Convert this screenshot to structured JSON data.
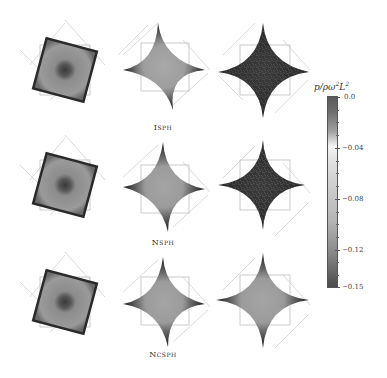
{
  "figure": {
    "rows": [
      {
        "label": "Isph",
        "label_y": 128
      },
      {
        "label": "Nsph",
        "label_y": 243
      },
      {
        "label": "Ncsph",
        "label_y": 355
      }
    ],
    "columns": 3,
    "panel_types": [
      "rotating-square",
      "star-developing",
      "star-developed"
    ]
  },
  "colorbar": {
    "title_base": "p/ρω",
    "title_exp1": "2",
    "title_mid": "L",
    "title_exp2": "2",
    "min": -0.15,
    "max": 0.0,
    "ticks": [
      {
        "value": "0.0",
        "y": 97
      },
      {
        "value": "−0.04",
        "y": 148
      },
      {
        "value": "−0.08",
        "y": 199
      },
      {
        "value": "−0.12",
        "y": 250
      },
      {
        "value": "−0.15",
        "y": 287
      }
    ],
    "colors": {
      "high": "#555555",
      "zero_band": "#5a5a5a",
      "light": "#f4f4f4",
      "mid": "#c4c4c4",
      "low": "#4a4a4a"
    }
  }
}
